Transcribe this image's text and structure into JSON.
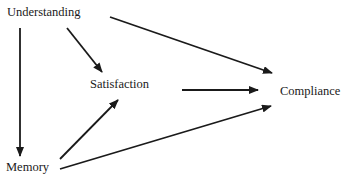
{
  "diagram": {
    "type": "path-diagram",
    "nodes": {
      "understanding": {
        "label": "Understanding",
        "x": 7,
        "y": 6
      },
      "satisfaction": {
        "label": "Satisfaction",
        "x": 90,
        "y": 78
      },
      "compliance": {
        "label": "Compliance",
        "x": 280,
        "y": 85
      },
      "memory": {
        "label": "Memory",
        "x": 6,
        "y": 161
      }
    },
    "edges": [
      {
        "from": "Understanding",
        "to": "Memory"
      },
      {
        "from": "Understanding",
        "to": "Satisfaction"
      },
      {
        "from": "Understanding",
        "to": "Compliance"
      },
      {
        "from": "Satisfaction",
        "to": "Compliance"
      },
      {
        "from": "Memory",
        "to": "Satisfaction"
      },
      {
        "from": "Memory",
        "to": "Compliance"
      }
    ],
    "colors": {
      "line": "#1a1a1a",
      "text": "#1a1a1a",
      "background": "#ffffff"
    }
  }
}
